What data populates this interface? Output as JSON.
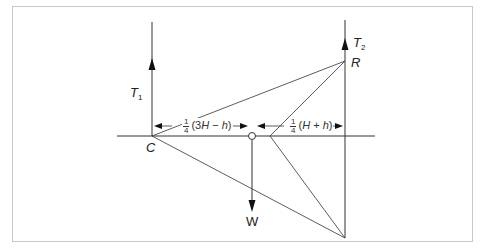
{
  "diagram": {
    "labels": {
      "t1": {
        "main": "T",
        "sub": "1"
      },
      "t2": {
        "main": "T",
        "sub": "2"
      },
      "r": "R",
      "c": "C",
      "w": "W"
    },
    "dimensions": {
      "left": {
        "num": "1",
        "den": "4",
        "expr_open": "(3",
        "var1": "H",
        "op": " − ",
        "var2": "h",
        "expr_close": ")"
      },
      "right": {
        "num": "1",
        "den": "4",
        "expr_open": "(",
        "var1": "H",
        "op": " + ",
        "var2": "h",
        "expr_close": ")"
      }
    },
    "colors": {
      "line": "#333333",
      "frame": "#c8c8c8"
    }
  }
}
